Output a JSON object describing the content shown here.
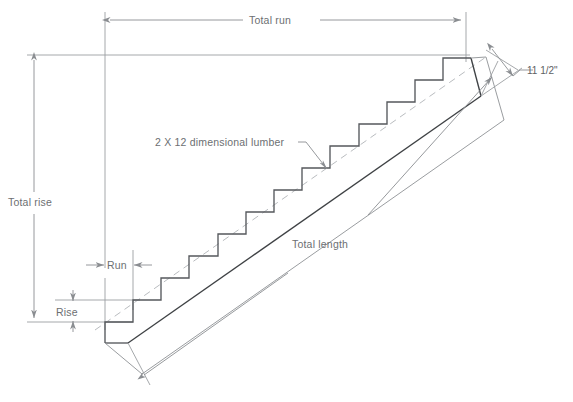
{
  "diagram": {
    "labels": {
      "total_run": "Total run",
      "total_rise": "Total rise",
      "total_length": "Total length",
      "run": "Run",
      "rise": "Rise",
      "lumber": "2 X 12 dimensional lumber",
      "board_width": "11 1/2\""
    },
    "colors": {
      "background": "#ffffff",
      "dimension_line": "#8a8d91",
      "stringer_outline": "#55585c",
      "board_outline": "#9a9da0",
      "dashed_guide": "#b9bcbf",
      "text": "#6c6f72"
    },
    "geometry": {
      "step_count": 12,
      "run_px": 28.2,
      "rise_px": 22,
      "bottom_step_x": 105,
      "bottom_step_y": 322,
      "top_step_x": 443,
      "top_step_y": 58,
      "board_width_px": 38,
      "slope_label": "rise over run"
    }
  },
  "annotations": [
    {
      "name": "total-run",
      "text": "Total run",
      "orientation": "horizontal"
    },
    {
      "name": "total-rise",
      "text": "Total rise",
      "orientation": "vertical"
    },
    {
      "name": "total-length",
      "text": "Total length",
      "orientation": "diagonal"
    },
    {
      "name": "run",
      "text": "Run",
      "orientation": "horizontal"
    },
    {
      "name": "rise",
      "text": "Rise",
      "orientation": "vertical"
    },
    {
      "name": "lumber-callout",
      "text": "2 X 12 dimensional lumber",
      "orientation": "leader"
    },
    {
      "name": "board-width",
      "text": "11 1/2\"",
      "orientation": "diagonal"
    }
  ]
}
